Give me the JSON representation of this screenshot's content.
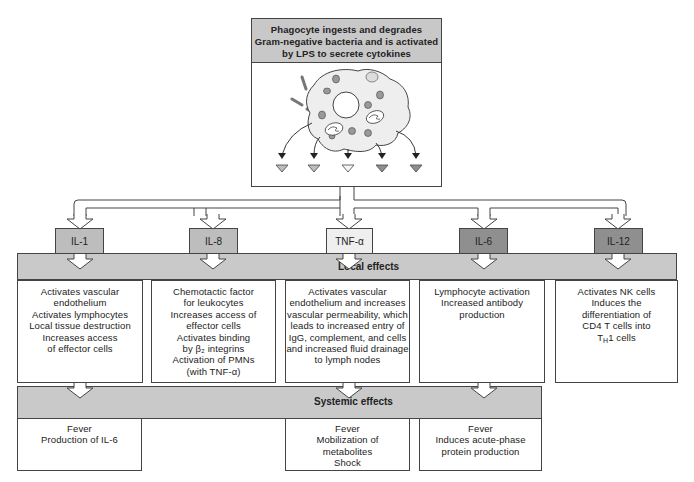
{
  "header": {
    "lines": [
      "Phagocyte ingests and degrades",
      "Gram-negative bacteria and is activated",
      "by LPS to secrete cytokines"
    ]
  },
  "colors": {
    "header_fill": "#c8c8c8",
    "banner_fill": "#c9c9c9",
    "cell_fill": "#eeeeee",
    "light_cytokine": "#efefef",
    "mid_cytokine": "#bdbdbd",
    "dark_cytokine": "#8f8f8f",
    "line": "#444444"
  },
  "cytokines": [
    {
      "label": "IL-1",
      "shade": "mid"
    },
    {
      "label": "IL-8",
      "shade": "mid"
    },
    {
      "label": "TNF-α",
      "shade": "light"
    },
    {
      "label": "IL-6",
      "shade": "dark"
    },
    {
      "label": "IL-12",
      "shade": "dark"
    }
  ],
  "local_effects": {
    "title": "Local effects",
    "cells": [
      {
        "lines": [
          "Activates vascular",
          "endothelium",
          "Activates lymphocytes",
          "Local tissue destruction",
          "Increases access",
          "of effector cells"
        ]
      },
      {
        "lines": [
          "Chemotactic factor",
          "for leukocytes",
          "Increases access of",
          "effector cells",
          "Activates binding",
          "by β₂ integrins",
          "Activation of PMNs",
          "(with TNF-α)"
        ]
      },
      {
        "lines": [
          "Activates vascular",
          "endothelium and increases",
          "vascular permeability, which",
          "leads to increased entry of",
          "IgG, complement, and cells",
          "and increased fluid drainage",
          "to lymph nodes"
        ]
      },
      {
        "lines": [
          "Lymphocyte activation",
          "Increased antibody",
          "production"
        ]
      },
      {
        "lines": [
          "Activates NK cells",
          "Induces the",
          "differentiation of",
          "CD4 T cells into",
          "T<sub>H</sub>1 cells"
        ]
      }
    ]
  },
  "systemic_effects": {
    "title": "Systemic effects",
    "cells": [
      {
        "lines": [
          "Fever",
          "Production of IL-6"
        ]
      },
      {
        "lines": [
          "Fever",
          "Mobilization of",
          "metabolites",
          "Shock"
        ]
      },
      {
        "lines": [
          "Fever",
          "Induces acute-phase",
          "protein production"
        ]
      }
    ]
  },
  "icons": {
    "phagocyte": "phagocyte-cell-icon",
    "bacteria": "bacteria-icon",
    "secretion": "cytokine-triangle-icon"
  }
}
